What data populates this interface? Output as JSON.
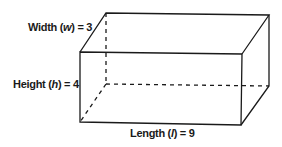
{
  "diagram": {
    "type": "rectangular-prism",
    "labels": {
      "width": {
        "name": "Width",
        "var": "w",
        "value": "3"
      },
      "height": {
        "name": "Height",
        "var": "h",
        "value": "4"
      },
      "length": {
        "name": "Length",
        "var": "l",
        "value": "9"
      }
    },
    "colors": {
      "line": "#1a1a1a",
      "background": "#ffffff"
    }
  }
}
